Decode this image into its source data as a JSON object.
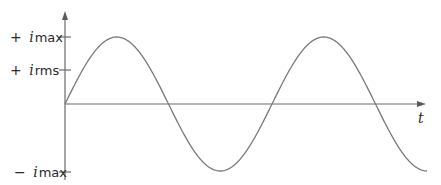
{
  "diagram": {
    "y_axis": {
      "labels": [
        {
          "sign": "+",
          "symbol": "i",
          "subscript": "max",
          "y": 37
        },
        {
          "sign": "+",
          "symbol": "i",
          "subscript": "rms",
          "y": 70
        },
        {
          "sign": "−",
          "symbol": "i",
          "subscript": "max",
          "y": 172
        }
      ]
    },
    "x_axis": {
      "label": "t"
    },
    "curve": {
      "type": "sine",
      "cycles": 2,
      "amplitude_label": "i_max"
    },
    "colors": {
      "axis": "#6a6a6a",
      "curve": "#7a7a7a",
      "text": "#2a2a2a"
    }
  }
}
